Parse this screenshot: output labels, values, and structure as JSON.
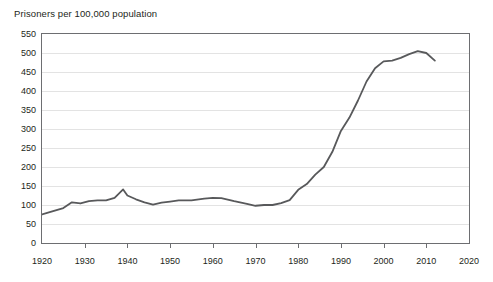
{
  "chart_data": {
    "type": "line",
    "title": "Prisoners per 100,000 population",
    "xlabel": "",
    "ylabel": "",
    "xlim": [
      1920,
      2020
    ],
    "ylim": [
      0,
      550
    ],
    "ytick_step": 50,
    "xtick_step": 10,
    "grid": "horizontal",
    "legend": "none",
    "line_color": "#58595b",
    "gridline_color": "#e3e3e3",
    "axis_color": "#6d6e71",
    "background": "#ffffff",
    "ytick_labels": [
      "0",
      "50",
      "100",
      "150",
      "200",
      "250",
      "300",
      "350",
      "400",
      "450",
      "500",
      "550"
    ],
    "ytick_values": [
      0,
      50,
      100,
      150,
      200,
      250,
      300,
      350,
      400,
      450,
      500,
      550
    ],
    "xtick_labels": [
      "1920",
      "1930",
      "1940",
      "1950",
      "1960",
      "1970",
      "1980",
      "1990",
      "2000",
      "2010",
      "2020"
    ],
    "xtick_values": [
      1920,
      1930,
      1940,
      1950,
      1960,
      1970,
      1980,
      1990,
      2000,
      2010,
      2020
    ],
    "series": [
      {
        "name": "Prisoners per 100,000 population",
        "x": [
          1920,
          1922,
          1925,
          1927,
          1929,
          1931,
          1933,
          1935,
          1937,
          1939,
          1940,
          1942,
          1944,
          1946,
          1948,
          1950,
          1952,
          1955,
          1958,
          1960,
          1962,
          1965,
          1968,
          1970,
          1972,
          1974,
          1976,
          1978,
          1980,
          1982,
          1984,
          1986,
          1988,
          1990,
          1992,
          1994,
          1996,
          1998,
          2000,
          2002,
          2004,
          2006,
          2008,
          2010,
          2012
        ],
        "y": [
          75,
          82,
          92,
          107,
          104,
          110,
          112,
          112,
          119,
          141,
          125,
          115,
          107,
          101,
          106,
          109,
          112,
          112,
          117,
          119,
          118,
          110,
          103,
          98,
          100,
          100,
          105,
          113,
          140,
          155,
          180,
          200,
          240,
          295,
          330,
          375,
          425,
          460,
          478,
          480,
          487,
          497,
          505,
          500,
          480
        ]
      }
    ]
  }
}
